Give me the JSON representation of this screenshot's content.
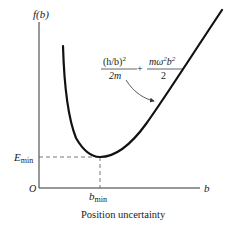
{
  "diagram": {
    "y_axis_label": "f(b)",
    "x_axis_label": "b",
    "origin_label": "O",
    "e_min_label": {
      "main": "E",
      "sub": "min"
    },
    "b_min_label": {
      "main": "b",
      "sub": "min"
    },
    "x_caption": "Position uncertainty",
    "formula": {
      "term1_numerator": "(h/b)",
      "term1_numerator_exp": "2",
      "term1_denominator": "2m",
      "operator": "+",
      "term2_numerator": "mω",
      "term2_numerator_exp1": "2",
      "term2_numerator_b": "b",
      "term2_numerator_exp2": "2",
      "term2_denominator": "2"
    },
    "colors": {
      "curve": "#111111",
      "axis": "#333333",
      "dashed": "#555555",
      "text": "#1a1a1a"
    }
  }
}
